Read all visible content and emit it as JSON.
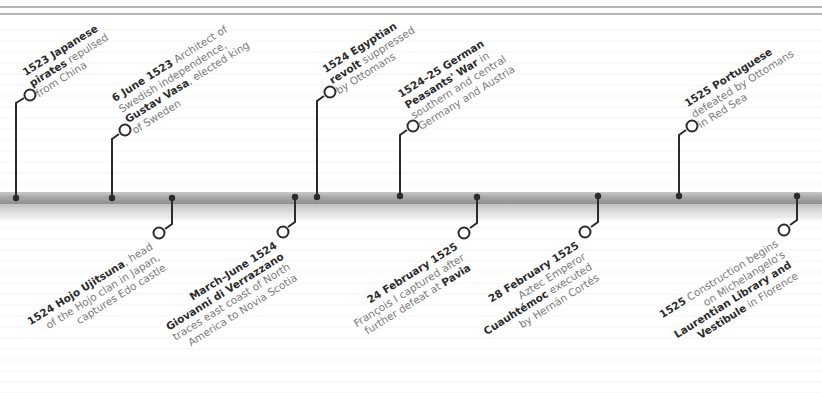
{
  "colors": {
    "axis": "#a8a8a8",
    "connector": "#2b2b2b",
    "bold_text": "#2b2b2b",
    "body_text": "#7b7b7b",
    "rule": "#b5b5b5"
  },
  "events_above": [
    {
      "id": "japanese-pirates",
      "lines": [
        {
          "bold": "1523 Japanese",
          "text": ""
        },
        {
          "bold": "pirates",
          "text": " repulsed"
        },
        {
          "bold": "",
          "text": "from China"
        }
      ]
    },
    {
      "id": "gustav-vasa",
      "lines": [
        {
          "bold": "6 June 1523",
          "text": " Architect of"
        },
        {
          "bold": "",
          "text": "Swedish independence,"
        },
        {
          "bold": "Gustav Vasa",
          "text": ", elected king"
        },
        {
          "bold": "",
          "text": "of Sweden"
        }
      ]
    },
    {
      "id": "egyptian-revolt",
      "lines": [
        {
          "bold": "1524 Egyptian",
          "text": ""
        },
        {
          "bold": "revolt",
          "text": " suppressed"
        },
        {
          "bold": "",
          "text": "by Ottomans"
        }
      ]
    },
    {
      "id": "peasants-war",
      "lines": [
        {
          "bold": "1524–25 German",
          "text": ""
        },
        {
          "bold": "Peasants' War",
          "text": " in"
        },
        {
          "bold": "",
          "text": "southern and central"
        },
        {
          "bold": "",
          "text": "Germany and Austria"
        }
      ]
    },
    {
      "id": "portuguese-defeated",
      "lines": [
        {
          "bold": "1525 Portuguese",
          "text": ""
        },
        {
          "bold": "",
          "text": "defeated by Ottomans"
        },
        {
          "bold": "",
          "text": "in Red Sea"
        }
      ]
    }
  ],
  "events_below": [
    {
      "id": "hojo-ujitsuna",
      "lines": [
        {
          "bold": "1524 Hojo Ujitsuna",
          "text": ", head"
        },
        {
          "bold": "",
          "text": "of the Hojo clan in Japan,"
        },
        {
          "bold": "",
          "text": "captures Edo castle"
        }
      ]
    },
    {
      "id": "verrazzano",
      "lines": [
        {
          "bold": "March–June 1524",
          "text": ""
        },
        {
          "bold": "Giovanni di Verrazzano",
          "text": ""
        },
        {
          "bold": "",
          "text": "traces east coast of North"
        },
        {
          "bold": "",
          "text": "America to Novia Scotia"
        }
      ]
    },
    {
      "id": "pavia",
      "lines": [
        {
          "bold": "24 February 1525",
          "text": ""
        },
        {
          "bold": "",
          "text": "François I captured after"
        },
        {
          "bold": "",
          "text": "further defeat at ",
          "bold2": "Pavia"
        }
      ]
    },
    {
      "id": "cuauhtemoc",
      "lines": [
        {
          "bold": "28 February 1525",
          "text": ""
        },
        {
          "bold": "",
          "text": "Aztec Emperor"
        },
        {
          "bold": "Cuauhtémoc",
          "text": " executed"
        },
        {
          "bold": "",
          "text": "by Hernán Cortés"
        }
      ]
    },
    {
      "id": "laurentian-library",
      "lines": [
        {
          "bold": "1525",
          "text": " Construction begins"
        },
        {
          "bold": "",
          "text": "on Michelangelo's"
        },
        {
          "bold": "Laurentian Library and",
          "text": ""
        },
        {
          "bold": "Vestibule",
          "text": " in Florence"
        }
      ]
    }
  ]
}
